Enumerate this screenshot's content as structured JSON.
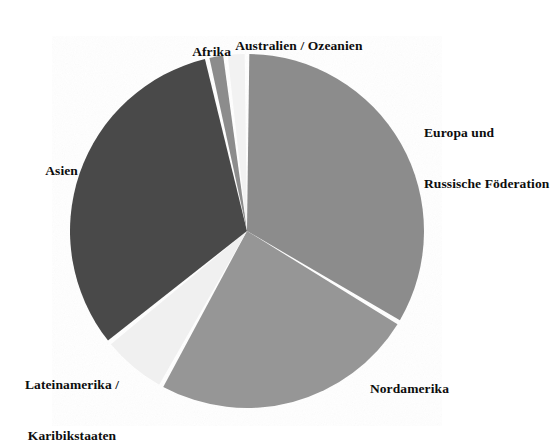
{
  "chart_data": {
    "type": "pie",
    "title": "",
    "subtitle": "",
    "xlabel": "",
    "ylabel": "",
    "legend_position": "none",
    "grid": false,
    "units": "percent",
    "label_placement": "outside",
    "start_angle_deg": 0,
    "direction": "clockwise",
    "center": {
      "x": 247,
      "y": 231
    },
    "radius": 177,
    "categories": [
      "Europa und Russische Föderation",
      "Nordamerika",
      "Lateinamerika / Karibikstaaten",
      "Asien",
      "Afrika",
      "Australien / Ozeanien"
    ],
    "values": [
      33.6,
      24.4,
      6.1,
      32.2,
      1.7,
      2.0
    ],
    "slices": [
      {
        "label": "Europa und Russische Föderation",
        "label_lines": [
          "Europa und",
          "Russische Föderation"
        ],
        "value": 33.6,
        "start_angle_deg": 0,
        "end_angle_deg": 121,
        "color": "#8c8c8c"
      },
      {
        "label": "Nordamerika",
        "label_lines": [
          "Nordamerika"
        ],
        "value": 24.4,
        "start_angle_deg": 121,
        "end_angle_deg": 209,
        "color": "#969696"
      },
      {
        "label": "Lateinamerika / Karibikstaaten",
        "label_lines": [
          "Lateinamerika /",
          "Karibikstaaten"
        ],
        "value": 6.1,
        "start_angle_deg": 209,
        "end_angle_deg": 231,
        "color": "#f0f0f0"
      },
      {
        "label": "Asien",
        "label_lines": [
          "Asien"
        ],
        "value": 32.2,
        "start_angle_deg": 231,
        "end_angle_deg": 347,
        "color": "#4a4a4a"
      },
      {
        "label": "Afrika",
        "label_lines": [
          "Afrika"
        ],
        "value": 1.7,
        "start_angle_deg": 347,
        "end_angle_deg": 353,
        "color": "#8c8c8c"
      },
      {
        "label": "Australien / Ozeanien",
        "label_lines": [
          "Australien / Ozeanien"
        ],
        "value": 2.0,
        "start_angle_deg": 353,
        "end_angle_deg": 360,
        "color": "#f2f2f2"
      }
    ]
  },
  "labels": {
    "europa_line1": "Europa und",
    "europa_line2": "Russische Föderation",
    "nordamerika": "Nordamerika",
    "lateinamerika_line1": "Lateinamerika /",
    "lateinamerika_line2": "Karibikstaaten",
    "asien": "Asien",
    "afrika": "Afrika",
    "australien": "Australien / Ozeanien"
  },
  "colors": {
    "background": "#ffffff",
    "text": "#0d0d0d",
    "slice_europa": "#8c8c8c",
    "slice_nordamerika": "#969696",
    "slice_lateinamerika": "#f0f0f0",
    "slice_asien": "#4a4a4a",
    "slice_afrika": "#8c8c8c",
    "slice_australien": "#f2f2f2",
    "slice_separator": "#ffffff"
  }
}
